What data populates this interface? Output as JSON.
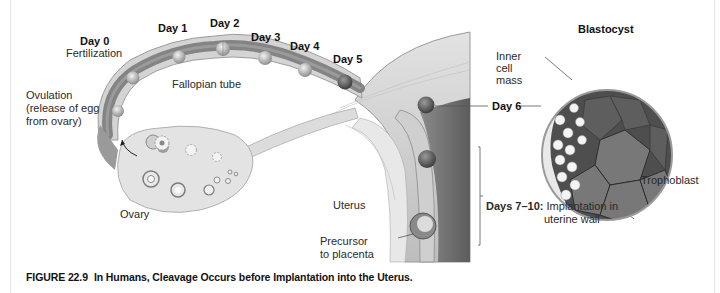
{
  "figure": {
    "number": "FIGURE 22.9",
    "title": "In Humans, Cleavage Occurs before Implantation into the Uterus."
  },
  "labels": {
    "day0": "Day 0",
    "fertilization": "Fertilization",
    "day1": "Day 1",
    "day2": "Day 2",
    "day3": "Day 3",
    "day4": "Day 4",
    "day5": "Day 5",
    "day6": "Day 6",
    "fallopian_tube": "Fallopian tube",
    "ovulation_line1": "Ovulation",
    "ovulation_line2": "(release of egg",
    "ovulation_line3": "from ovary)",
    "ovary": "Ovary",
    "uterus": "Uterus",
    "precursor_line1": "Precursor",
    "precursor_line2": "to placenta",
    "days_7_10": "Days 7–10:",
    "implantation_line1": "Implantation in",
    "implantation_line2": "uterine wall",
    "blastocyst": "Blastocyst",
    "inner_line1": "Inner",
    "inner_line2": "cell",
    "inner_line3": "mass",
    "trophoblast": "Trophoblast"
  },
  "colors": {
    "tube_outer": "#cfcfcf",
    "tube_inner": "#7d7d7d",
    "embryo": "#bdbdbd",
    "uterus_wall": "#6e6e6e",
    "inner_cell_mass": "#e6e6e6",
    "trophoblast_dark": "#5a5a5a"
  }
}
